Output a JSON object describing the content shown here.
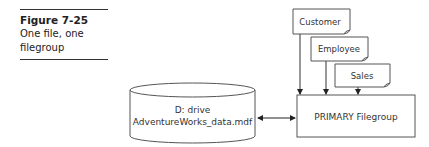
{
  "caption": {
    "figure_label": "Figure 7-25",
    "description_line1": "One file, one",
    "description_line2": "filegroup"
  },
  "diagram": {
    "disk": {
      "line1": "D: drive",
      "line2": "AdventureWorks_data.mdf"
    },
    "filegroup": {
      "label": "PRIMARY Filegroup"
    },
    "tables": [
      {
        "label": "Customer"
      },
      {
        "label": "Employee"
      },
      {
        "label": "Sales"
      }
    ],
    "connector": {
      "type": "bidirectional-arrow"
    }
  }
}
